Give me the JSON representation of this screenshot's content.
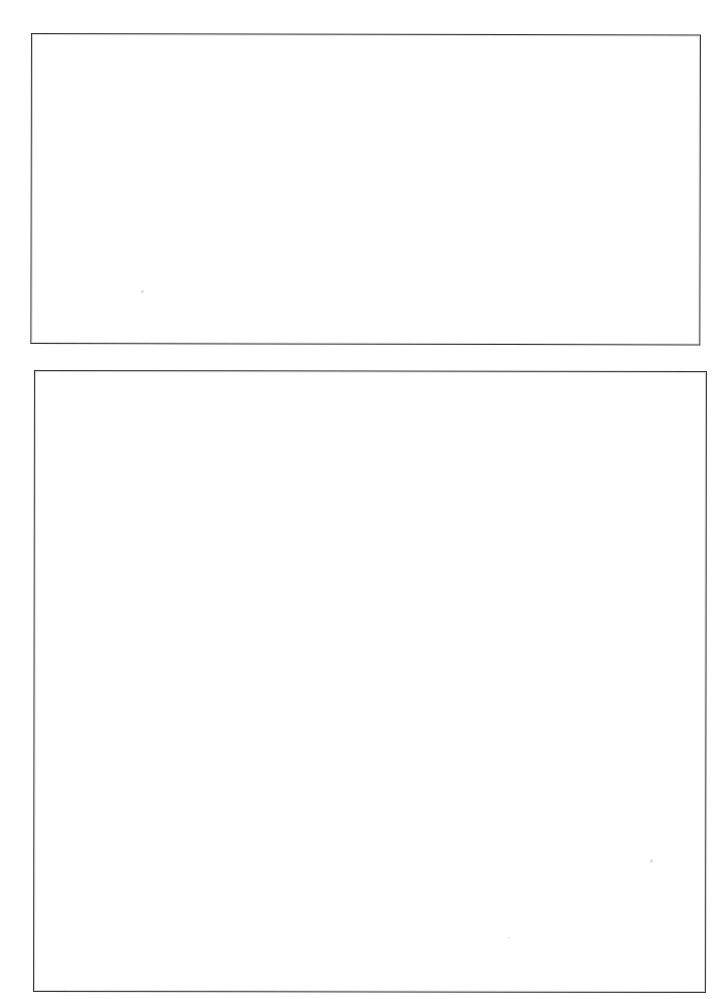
{
  "page": {
    "kind": "scanned-document-page",
    "width": 724,
    "height": 999,
    "background_color": "#ffffff",
    "visible_text": ""
  },
  "frames": [
    {
      "id": "frame-top",
      "label": "",
      "content": "",
      "border_color": "#3a3a3a",
      "fill_color": "#ffffff",
      "x": 31,
      "y": 33,
      "width": 670,
      "height": 311
    },
    {
      "id": "frame-bottom",
      "label": "",
      "content": "",
      "border_color": "#3a3a3a",
      "fill_color": "#ffffff",
      "x": 34,
      "y": 370,
      "width": 673,
      "height": 622
    }
  ],
  "artifacts": [
    {
      "id": "speck-a",
      "x": 141,
      "y": 290,
      "color": "#a0a0a6"
    },
    {
      "id": "speck-b",
      "x": 650,
      "y": 859,
      "color": "#a0a0a6"
    },
    {
      "id": "speck-c",
      "x": 508,
      "y": 937,
      "color": "#aaaab0"
    }
  ]
}
